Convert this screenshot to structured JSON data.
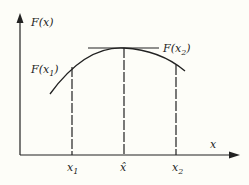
{
  "diagram": {
    "y_axis_label": "F(x)",
    "x_axis_label": "x",
    "points": [
      {
        "name": "x1",
        "label_base": "x",
        "label_sub": "1",
        "func_label_base": "F(x",
        "func_label_sub": "1",
        "func_label_close": ")"
      },
      {
        "name": "x-hat",
        "label": "x̂"
      },
      {
        "name": "x2",
        "label_base": "x",
        "label_sub": "2",
        "func_label_base": "F(x",
        "func_label_sub": "2",
        "func_label_close": ")"
      }
    ],
    "colors": {
      "ink": "#222222",
      "background": "#fdfdf8"
    }
  }
}
